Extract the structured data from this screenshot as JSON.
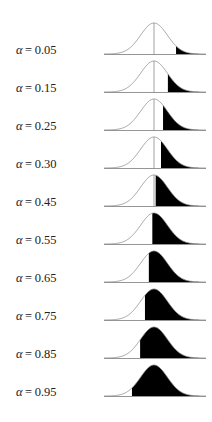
{
  "figure": {
    "type": "normal-distribution-tail-shading",
    "colors": {
      "curve": "#8a8a8a",
      "fill": "#000000",
      "baseline": "#8a8a8a",
      "center_line": "#8a8a8a"
    },
    "rows": [
      {
        "symbol": "α",
        "equals": "=",
        "value": "0.05",
        "alpha": 0.05
      },
      {
        "symbol": "α",
        "equals": "=",
        "value": "0.15",
        "alpha": 0.15
      },
      {
        "symbol": "α",
        "equals": "=",
        "value": "0.25",
        "alpha": 0.25
      },
      {
        "symbol": "α",
        "equals": "=",
        "value": "0.30",
        "alpha": 0.3
      },
      {
        "symbol": "α",
        "equals": "=",
        "value": "0.45",
        "alpha": 0.45
      },
      {
        "symbol": "α",
        "equals": "=",
        "value": "0.55",
        "alpha": 0.55
      },
      {
        "symbol": "α",
        "equals": "=",
        "value": "0.65",
        "alpha": 0.65
      },
      {
        "symbol": "α",
        "equals": "=",
        "value": "0.75",
        "alpha": 0.75
      },
      {
        "symbol": "α",
        "equals": "=",
        "value": "0.85",
        "alpha": 0.85
      },
      {
        "symbol": "α",
        "equals": "=",
        "value": "0.95",
        "alpha": 0.95
      }
    ]
  }
}
